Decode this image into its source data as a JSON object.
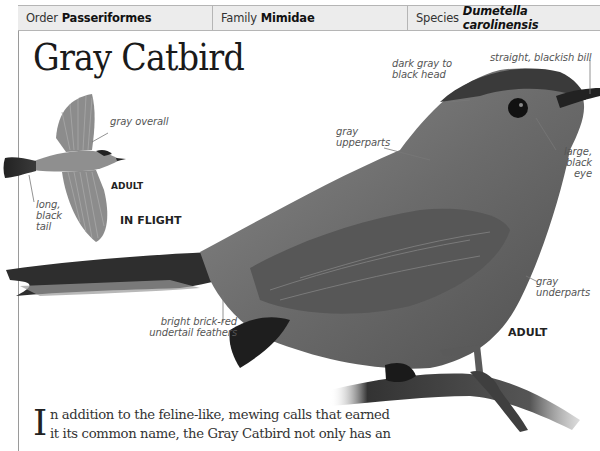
{
  "taxonomy": {
    "order": {
      "label": "Order",
      "value": "Passeriformes"
    },
    "family": {
      "label": "Family",
      "value": "Mimidae"
    },
    "species": {
      "label": "Species",
      "value": "Dumetella carolinensis"
    }
  },
  "title": "Gray Catbird",
  "flight_illustration": {
    "labels": {
      "overall": "gray overall",
      "tail": "long, black tail"
    },
    "age_tag": "ADULT",
    "caption": "IN FLIGHT"
  },
  "main_photo": {
    "labels": {
      "head": "dark gray to black head",
      "bill": "straight, blackish bill",
      "upperparts": "gray upperparts",
      "eye": "large, black eye",
      "underparts": "gray underparts",
      "undertail": "bright brick-red undertail feathers"
    },
    "age_tag": "ADULT"
  },
  "body": {
    "drop_cap": "I",
    "text": "n addition to the feline-like, mewing calls that earned it its common name, the Gray Catbird not only has an"
  }
}
